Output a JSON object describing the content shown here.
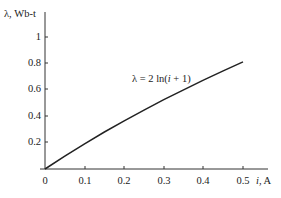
{
  "chart_data": {
    "type": "line",
    "title": "",
    "xlabel": "i, A",
    "ylabel": "λ, Wb-t",
    "xlim": [
      0,
      0.55
    ],
    "ylim": [
      0,
      1.1
    ],
    "x_ticks": [
      "0",
      "0.1",
      "0.2",
      "0.3",
      "0.4",
      "0.5"
    ],
    "y_ticks": [
      "0.2",
      "0.4",
      "0.6",
      "0.8",
      "1"
    ],
    "grid": false,
    "legend": null,
    "annotations": [
      {
        "text": "λ = 2 ln(i + 1)",
        "x": 0.26,
        "y": 0.62
      }
    ],
    "series": [
      {
        "name": "λ = 2 ln(i + 1)",
        "x": [
          0,
          0.05,
          0.1,
          0.15,
          0.2,
          0.25,
          0.3,
          0.35,
          0.4,
          0.45,
          0.5
        ],
        "values": [
          0,
          0.098,
          0.191,
          0.28,
          0.365,
          0.446,
          0.525,
          0.6,
          0.673,
          0.743,
          0.811
        ]
      }
    ]
  },
  "labels": {
    "ylabel": "λ, Wb-t",
    "xlabel_i": "i",
    "xlabel_unit": ", A",
    "annotation_prefix": "λ = 2 ln(",
    "annotation_var": "i",
    "annotation_suffix": " + 1)",
    "x_ticks": [
      "0",
      "0.1",
      "0.2",
      "0.3",
      "0.4",
      "0.5"
    ],
    "y_ticks": [
      "1",
      "0.8",
      "0.6",
      "0.4",
      "0.2"
    ]
  }
}
